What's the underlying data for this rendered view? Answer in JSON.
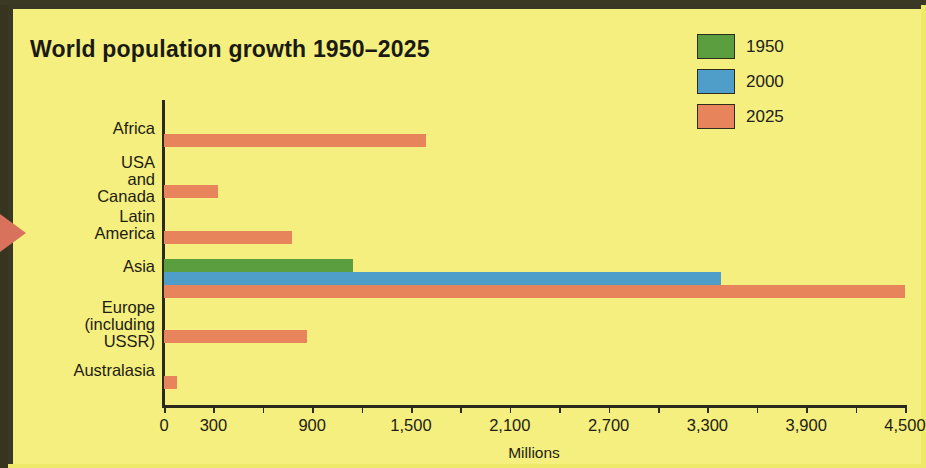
{
  "chart_data": {
    "type": "bar",
    "orientation": "horizontal",
    "title": "World population growth 1950–2025",
    "xlabel": "Millions",
    "ylabel": "",
    "xlim": [
      0,
      4500
    ],
    "grid": false,
    "legend_position": "top-right",
    "categories": [
      "Africa",
      "USA and\nCanada",
      "Latin America",
      "Asia",
      "Europe\n(including USSR)",
      "Australasia"
    ],
    "tick_labels": [
      "0",
      "300",
      "",
      "900",
      "",
      "1,500",
      "",
      "2,100",
      "",
      "2,700",
      "",
      "3,300",
      "",
      "3,900",
      "",
      "4,500"
    ],
    "tick_values": [
      0,
      300,
      600,
      900,
      1200,
      1500,
      1800,
      2100,
      2400,
      2700,
      3000,
      3300,
      3600,
      3900,
      4200,
      4500
    ],
    "series": [
      {
        "name": "1950",
        "color": "#5a9e3f",
        "values": [
          null,
          null,
          null,
          1150,
          null,
          null
        ]
      },
      {
        "name": "2000",
        "color": "#4f9ec9",
        "values": [
          null,
          null,
          null,
          3380,
          null,
          null
        ]
      },
      {
        "name": "2025",
        "color": "#e8845c",
        "values": [
          1590,
          330,
          780,
          4500,
          870,
          80
        ]
      }
    ]
  },
  "legend": {
    "items": [
      {
        "label": "1950",
        "color": "#5a9e3f"
      },
      {
        "label": "2000",
        "color": "#4f9ec9"
      },
      {
        "label": "2025",
        "color": "#e8845c"
      }
    ]
  },
  "colors": {
    "background": "#f4ef7e",
    "border": "#3a3724",
    "axis": "#2b2a1c",
    "text": "#1e1c13",
    "marker": "#d9725c"
  }
}
